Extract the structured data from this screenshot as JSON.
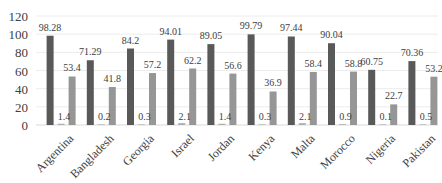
{
  "chart_data": {
    "type": "bar",
    "title": "",
    "xlabel": "",
    "ylabel": "",
    "ylim": [
      0,
      120
    ],
    "yticks": [
      0,
      20,
      40,
      60,
      80,
      100,
      120
    ],
    "grid": true,
    "legend": "none",
    "categories": [
      "Argentina",
      "Bangladesh",
      "Georgia",
      "Israel",
      "Jordan",
      "Kenya",
      "Malta",
      "Morocco",
      "Nigeria",
      "Pakistan"
    ],
    "series": [
      {
        "name": "Series 1",
        "color": "#595959",
        "values": [
          98.28,
          71.29,
          84.2,
          94.01,
          89.05,
          99.79,
          97.44,
          90.04,
          60.75,
          70.36
        ]
      },
      {
        "name": "Series 2",
        "color": "#b0b0b0",
        "values": [
          1.4,
          0.2,
          0.3,
          2.1,
          1.4,
          0.3,
          2.1,
          0.9,
          0.1,
          0.5
        ]
      },
      {
        "name": "Series 3",
        "color": "#969696",
        "values": [
          53.4,
          41.8,
          57.2,
          62.2,
          56.6,
          36.9,
          58.4,
          58.8,
          22.7,
          53.2
        ]
      }
    ]
  }
}
